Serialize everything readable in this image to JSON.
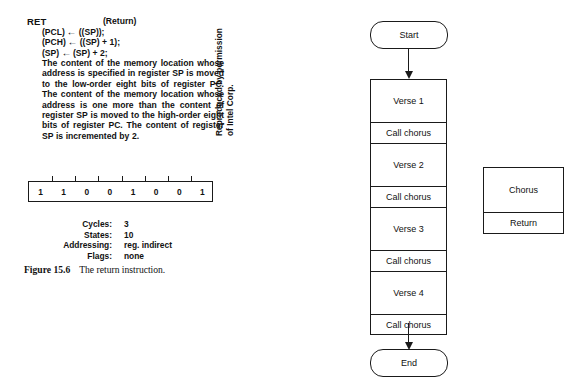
{
  "page": {
    "background": "#ffffff",
    "ink": "#1a1a1a"
  },
  "instruction": {
    "mnemonic": "RET",
    "long_name": "(Return)",
    "micro_operations": [
      {
        "left": "(PCL)",
        "arrow": "←",
        "right": "((SP));"
      },
      {
        "left": "(PCH)",
        "arrow": "←",
        "right": "((SP) + 1);"
      },
      {
        "left": "(SP)",
        "arrow": "←",
        "right": "(SP) + 2;"
      }
    ],
    "description": "The content of the memory location whose address is specified in register SP is moved to the low-order eight bits of register PC. The content of the memory location whose address is one more than the content of register SP is moved to the high-order eight bits of register PC. The content of register SP is incremented by 2.",
    "opcode_bits": [
      "1",
      "1",
      "0",
      "0",
      "1",
      "0",
      "0",
      "1"
    ],
    "timing": [
      {
        "label": "Cycles:",
        "value": "3"
      },
      {
        "label": "States:",
        "value": "10"
      },
      {
        "label": "Addressing:",
        "value": "reg. indirect"
      },
      {
        "label": "Flags:",
        "value": "none"
      }
    ]
  },
  "figure": {
    "number": "Figure 15.6",
    "caption": "The return instruction."
  },
  "credit": {
    "line1": "Reproduced by permission",
    "line2": "of Intel Corp."
  },
  "flowchart": {
    "start_label": "Start",
    "end_label": "End",
    "main_sequence": [
      {
        "type": "process",
        "label": "Verse 1",
        "size": "tall"
      },
      {
        "type": "process",
        "label": "Call chorus",
        "size": "short"
      },
      {
        "type": "process",
        "label": "Verse 2",
        "size": "tall"
      },
      {
        "type": "process",
        "label": "Call chorus",
        "size": "short"
      },
      {
        "type": "process",
        "label": "Verse 3",
        "size": "tall"
      },
      {
        "type": "process",
        "label": "Call chorus",
        "size": "short"
      },
      {
        "type": "process",
        "label": "Verse 4",
        "size": "tall"
      },
      {
        "type": "process",
        "label": "Call chorus",
        "size": "short"
      }
    ],
    "subroutine": {
      "body_label": "Chorus",
      "return_label": "Return"
    }
  }
}
